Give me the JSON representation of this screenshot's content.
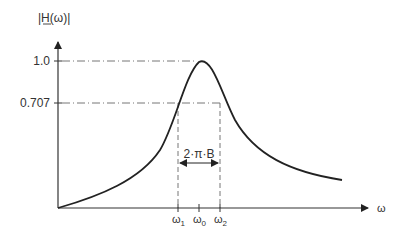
{
  "diagram": {
    "y_axis_label": "|H(ω)|",
    "x_axis_label": "ω",
    "y_ticks": [
      {
        "label": "1.0",
        "value": 1.0
      },
      {
        "label": "0.707",
        "value": 0.707
      }
    ],
    "x_ticks": [
      {
        "label": "ω",
        "sub": "1"
      },
      {
        "label": "ω",
        "sub": "0"
      },
      {
        "label": "ω",
        "sub": "2"
      }
    ],
    "bandwidth_label": "2·π·B",
    "colors": {
      "axis": "#333333",
      "curve": "#222222",
      "guides": "#555555"
    }
  }
}
